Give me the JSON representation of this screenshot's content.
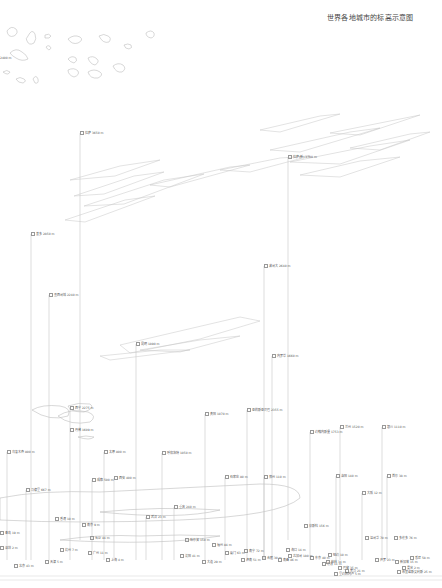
{
  "title": "世界各地城市的标高示意图",
  "colors": {
    "line": "#c8c8c8",
    "cloud": "#bdbdbd",
    "text": "#555555",
    "background": "#ffffff"
  },
  "top_left_label": {
    "text": "2400 m",
    "x": 0,
    "y": 56
  },
  "cities": [
    {
      "label": "拉萨 3650 m",
      "x": 80,
      "y": 133,
      "base": 540
    },
    {
      "label": "拉萨(新) 3700 m",
      "x": 288,
      "y": 157,
      "base": 540
    },
    {
      "label": "基多 2850 m",
      "x": 31,
      "y": 234,
      "base": 560
    },
    {
      "label": "波哥大 2640 m",
      "x": 264,
      "y": 266,
      "base": 560
    },
    {
      "label": "墨西哥城 2240 m",
      "x": 49,
      "y": 295,
      "base": 560
    },
    {
      "label": "昆明 1890 m",
      "x": 136,
      "y": 344,
      "base": 560
    },
    {
      "label": "内罗毕 1660 m",
      "x": 272,
      "y": 356,
      "base": 560
    },
    {
      "label": "西宁 2275 m",
      "x": 70,
      "y": 408,
      "base": 560
    },
    {
      "label": "亚的斯亚贝巴 2355 m",
      "x": 247,
      "y": 410,
      "base": 560
    },
    {
      "label": "贵阳 1070 m",
      "x": 205,
      "y": 414,
      "base": 560
    },
    {
      "label": "兰州 1520 m",
      "x": 340,
      "y": 427,
      "base": 560
    },
    {
      "label": "银川 1110 m",
      "x": 382,
      "y": 427,
      "base": 560
    },
    {
      "label": "约翰内斯堡 1753 m",
      "x": 310,
      "y": 432,
      "base": 560
    },
    {
      "label": "丹佛 1609 m",
      "x": 70,
      "y": 430,
      "base": 560
    },
    {
      "label": "乌鲁木齐 800 m",
      "x": 7,
      "y": 452,
      "base": 560
    },
    {
      "label": "太原 800 m",
      "x": 104,
      "y": 452,
      "base": 560
    },
    {
      "label": "呼和浩特 1050 m",
      "x": 162,
      "y": 453,
      "base": 560
    },
    {
      "label": "马德里 667 m",
      "x": 26,
      "y": 490,
      "base": 560
    },
    {
      "label": "西安 400 m",
      "x": 114,
      "y": 478,
      "base": 560
    },
    {
      "label": "成都 500 m",
      "x": 92,
      "y": 480,
      "base": 560
    },
    {
      "label": "石家庄 80 m",
      "x": 225,
      "y": 477,
      "base": 560
    },
    {
      "label": "郑州 110 m",
      "x": 264,
      "y": 477,
      "base": 560
    },
    {
      "label": "洛阳 140 m",
      "x": 336,
      "y": 476,
      "base": 560
    },
    {
      "label": "首尔 38 m",
      "x": 387,
      "y": 476,
      "base": 560
    },
    {
      "label": "大阪 12 m",
      "x": 362,
      "y": 493,
      "base": 560
    },
    {
      "label": "重庆 240 m",
      "x": 174,
      "y": 507,
      "base": 560
    },
    {
      "label": "武汉 23 m",
      "x": 146,
      "y": 517,
      "base": 560
    },
    {
      "label": "香港 10 m",
      "x": 55,
      "y": 519,
      "base": 560
    },
    {
      "label": "南京 9 m",
      "x": 82,
      "y": 525,
      "base": 560
    },
    {
      "label": "长沙 44 m",
      "x": 90,
      "y": 538,
      "base": 560
    },
    {
      "label": "杭州 7 m",
      "x": 60,
      "y": 550,
      "base": 560
    },
    {
      "label": "广州 11 m",
      "x": 88,
      "y": 553,
      "base": 560
    },
    {
      "label": "上海 4 m",
      "x": 106,
      "y": 560,
      "base": 570
    },
    {
      "label": "天津 5 m",
      "x": 45,
      "y": 562,
      "base": 570
    },
    {
      "label": "北京 43 m",
      "x": 14,
      "y": 566,
      "base": 575
    },
    {
      "label": "深圳 2 m",
      "x": 0,
      "y": 548,
      "base": 560
    },
    {
      "label": "青岛 19 m",
      "x": 0,
      "y": 533,
      "base": 545
    },
    {
      "label": "哈尔滨 150 m",
      "x": 185,
      "y": 540,
      "base": 560
    },
    {
      "label": "沈阳 41 m",
      "x": 180,
      "y": 556,
      "base": 570
    },
    {
      "label": "大连 29 m",
      "x": 202,
      "y": 562,
      "base": 575
    },
    {
      "label": "福州 84 m",
      "x": 212,
      "y": 545,
      "base": 565
    },
    {
      "label": "厦门 63 m",
      "x": 225,
      "y": 553,
      "base": 570
    },
    {
      "label": "南宁 72 m",
      "x": 244,
      "y": 551,
      "base": 565
    },
    {
      "label": "济南 51 m",
      "x": 241,
      "y": 560,
      "base": 570
    },
    {
      "label": "合肥 30 m",
      "x": 262,
      "y": 558,
      "base": 570
    },
    {
      "label": "南昌 46 m",
      "x": 278,
      "y": 560,
      "base": 570
    },
    {
      "label": "海口 14 m",
      "x": 286,
      "y": 550,
      "base": 560
    },
    {
      "label": "东京 40 m",
      "x": 310,
      "y": 558,
      "base": 570
    },
    {
      "label": "纽约 10 m",
      "x": 328,
      "y": 555,
      "base": 565
    },
    {
      "label": "伦敦 11 m",
      "x": 322,
      "y": 564,
      "base": 575
    },
    {
      "label": "巴黎 35 m",
      "x": 338,
      "y": 568,
      "base": 578
    },
    {
      "label": "莫斯科 156 m",
      "x": 304,
      "y": 526,
      "base": 545
    },
    {
      "label": "柏林 34 m",
      "x": 326,
      "y": 562,
      "base": 572
    },
    {
      "label": "罗马 21 m",
      "x": 345,
      "y": 571,
      "base": 580
    },
    {
      "label": "开罗 23 m",
      "x": 375,
      "y": 560,
      "base": 570
    },
    {
      "label": "新加坡 15 m",
      "x": 395,
      "y": 562,
      "base": 572
    },
    {
      "label": "曼谷 2 m",
      "x": 402,
      "y": 568,
      "base": 576
    },
    {
      "label": "悉尼 58 m",
      "x": 410,
      "y": 558,
      "base": 570
    },
    {
      "label": "多伦多 76 m",
      "x": 394,
      "y": 538,
      "base": 555
    },
    {
      "label": "温哥华 70 m",
      "x": 365,
      "y": 538,
      "base": 555
    },
    {
      "label": "芝加哥 180 m",
      "x": 288,
      "y": 556,
      "base": 570
    },
    {
      "label": "布宜诺斯艾利斯 25 m",
      "x": 397,
      "y": 572,
      "base": 582
    },
    {
      "label": "里约热内卢 5 m",
      "x": 334,
      "y": 574,
      "base": 584
    }
  ]
}
